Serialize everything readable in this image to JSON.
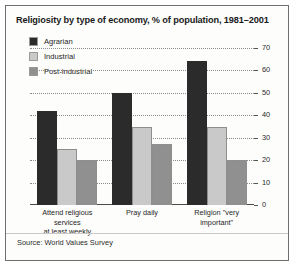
{
  "chart_data": {
    "type": "bar",
    "title": "Religiosity by type of economy, % of population, 1981–2001",
    "xlabel": "",
    "ylabel": "",
    "ylim": [
      0,
      70
    ],
    "yticks": [
      0,
      10,
      20,
      30,
      40,
      50,
      60,
      70
    ],
    "grid": true,
    "axis_position": "right",
    "legend_position": "top-left",
    "categories": [
      "Attend religious services at least weekly",
      "Pray daily",
      "Religion \"very important\""
    ],
    "category_lines": [
      [
        "Attend religious services",
        "at least weekly"
      ],
      [
        "Pray daily"
      ],
      [
        "Religion \"very important\""
      ]
    ],
    "series": [
      {
        "name": "Agrarian",
        "color": "#2b2b2b",
        "values": [
          42,
          50,
          64
        ]
      },
      {
        "name": "Industrial",
        "color": "#c9c9c9",
        "values": [
          25,
          35,
          35
        ]
      },
      {
        "name": "Post-industrial",
        "color": "#909090",
        "values": [
          20,
          27,
          20
        ]
      }
    ],
    "source": "Source: World Values Survey"
  }
}
